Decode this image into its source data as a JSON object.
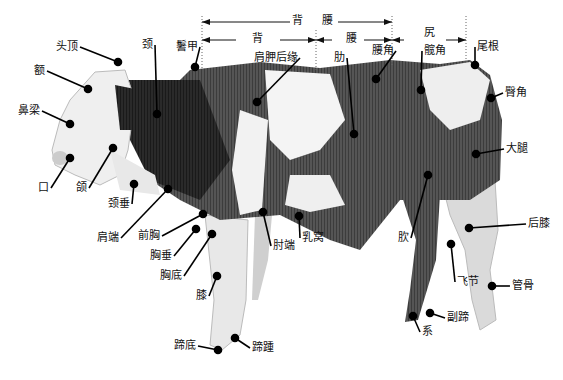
{
  "diagram": {
    "dimension_bars": {
      "top": {
        "label": "背 腰",
        "x1": 202,
        "x2": 392,
        "y": 22
      },
      "back": {
        "label": "背",
        "x1": 202,
        "x2": 316,
        "y": 40
      },
      "loin": {
        "label": "腰",
        "x1": 316,
        "x2": 392,
        "y": 40
      },
      "rump": {
        "label": "尻",
        "x1": 392,
        "x2": 466,
        "y": 40
      }
    },
    "labels": [
      {
        "id": "crown",
        "text": "头顶",
        "x": 56,
        "y": 47,
        "px": 118,
        "py": 62
      },
      {
        "id": "forehead",
        "text": "额",
        "x": 34,
        "y": 71,
        "px": 88,
        "py": 89
      },
      {
        "id": "nose-bridge",
        "text": "鼻梁",
        "x": 18,
        "y": 111,
        "px": 70,
        "py": 124
      },
      {
        "id": "mouth",
        "text": "口",
        "x": 38,
        "y": 188,
        "px": 70,
        "py": 158
      },
      {
        "id": "jaw",
        "text": "颌",
        "x": 76,
        "y": 188,
        "px": 113,
        "py": 148
      },
      {
        "id": "neck",
        "text": "颈",
        "x": 142,
        "y": 45,
        "px": 157,
        "py": 114
      },
      {
        "id": "withers",
        "text": "鬐甲",
        "x": 176,
        "y": 47,
        "px": 195,
        "py": 67
      },
      {
        "id": "scapula-edge",
        "text": "肩胛后缘",
        "x": 254,
        "y": 58,
        "px": 257,
        "py": 102
      },
      {
        "id": "rib",
        "text": "肋",
        "x": 334,
        "y": 58,
        "px": 354,
        "py": 134
      },
      {
        "id": "hip",
        "text": "腰角",
        "x": 372,
        "y": 51,
        "px": 376,
        "py": 79
      },
      {
        "id": "rump",
        "text": "尻",
        "x": 424,
        "y": 33,
        "px": null,
        "py": null
      },
      {
        "id": "sacrum-angle",
        "text": "髋角",
        "x": 424,
        "y": 51,
        "px": 421,
        "py": 90
      },
      {
        "id": "tail-root",
        "text": "尾根",
        "x": 477,
        "y": 47,
        "px": 475,
        "py": 65
      },
      {
        "id": "pin-bone",
        "text": "臀角",
        "x": 505,
        "y": 93,
        "px": 491,
        "py": 98
      },
      {
        "id": "thigh",
        "text": "大腿",
        "x": 506,
        "y": 149,
        "px": 476,
        "py": 154
      },
      {
        "id": "dewlap",
        "text": "颈垂",
        "x": 108,
        "y": 204,
        "px": 134,
        "py": 184
      },
      {
        "id": "shoulder-point",
        "text": "肩端",
        "x": 97,
        "y": 238,
        "px": 168,
        "py": 189
      },
      {
        "id": "fore-chest",
        "text": "前胸",
        "x": 138,
        "y": 236,
        "px": 203,
        "py": 214
      },
      {
        "id": "brisket",
        "text": "胸垂",
        "x": 150,
        "y": 256,
        "px": 196,
        "py": 229
      },
      {
        "id": "chest-floor",
        "text": "胸底",
        "x": 160,
        "y": 276,
        "px": 212,
        "py": 234
      },
      {
        "id": "elbow",
        "text": "肘端",
        "x": 273,
        "y": 246,
        "px": 263,
        "py": 212
      },
      {
        "id": "milk-well",
        "text": "乳窝",
        "x": 302,
        "y": 238,
        "px": 299,
        "py": 216
      },
      {
        "id": "knee",
        "text": "膝",
        "x": 196,
        "y": 296,
        "px": 217,
        "py": 276
      },
      {
        "id": "flank",
        "text": "肷",
        "x": 398,
        "y": 238,
        "px": 428,
        "py": 175
      },
      {
        "id": "stifle",
        "text": "后膝",
        "x": 528,
        "y": 224,
        "px": 469,
        "py": 228
      },
      {
        "id": "hock",
        "text": "飞节",
        "x": 457,
        "y": 282,
        "px": 451,
        "py": 244
      },
      {
        "id": "cannon",
        "text": "管骨",
        "x": 512,
        "y": 286,
        "px": 492,
        "py": 286
      },
      {
        "id": "dewclaw",
        "text": "副蹄",
        "x": 447,
        "y": 318,
        "px": 430,
        "py": 313
      },
      {
        "id": "pastern",
        "text": "系",
        "x": 422,
        "y": 332,
        "px": 413,
        "py": 316
      },
      {
        "id": "sole",
        "text": "蹄底",
        "x": 174,
        "y": 346,
        "px": 218,
        "py": 350
      },
      {
        "id": "heel",
        "text": "蹄踵",
        "x": 252,
        "y": 348,
        "px": 235,
        "py": 338
      }
    ]
  }
}
